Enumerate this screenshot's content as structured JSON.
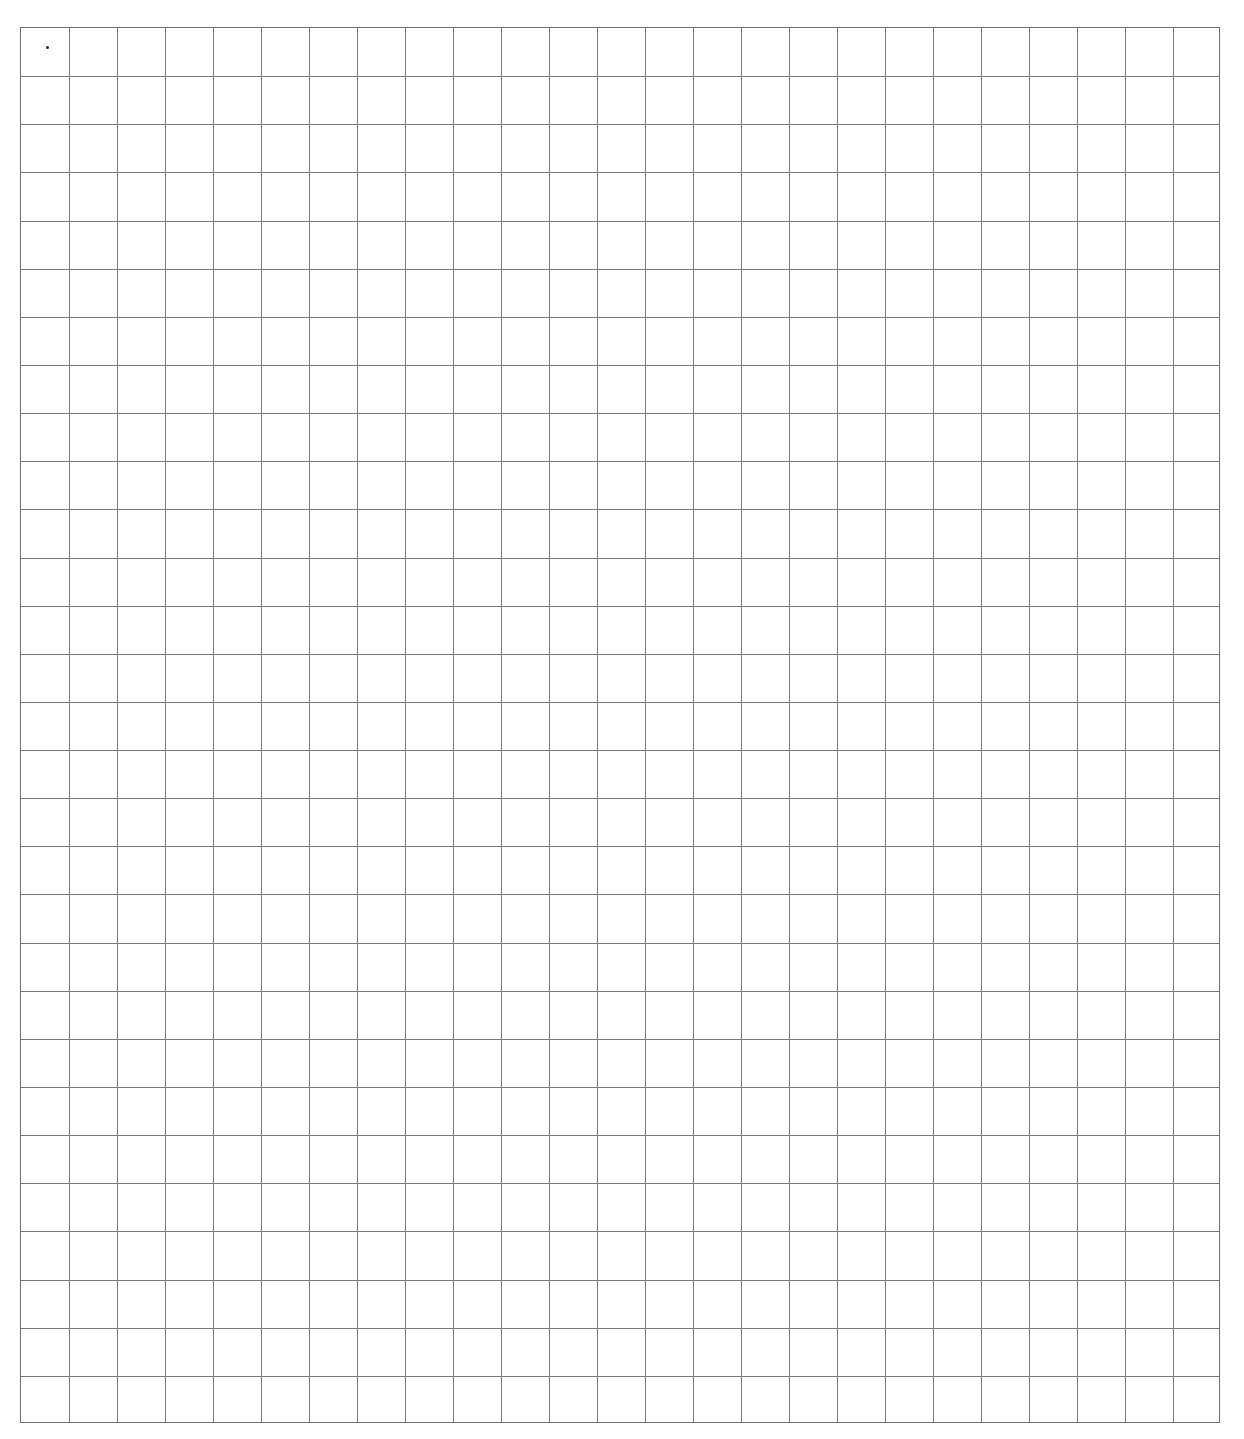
{
  "page": {
    "type": "graph-paper",
    "background": "#ffffff",
    "line_color": "#7a7a7a"
  },
  "grid": {
    "left": 20,
    "top": 27,
    "width": 1200,
    "height": 1396,
    "columns": 25,
    "rows": 29
  },
  "marks": [
    {
      "x": 47,
      "y": 47
    }
  ]
}
